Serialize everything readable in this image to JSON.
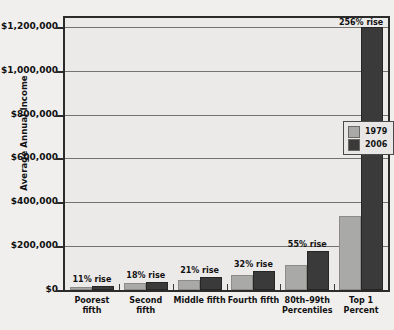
{
  "chart_data": {
    "type": "bar",
    "title": "",
    "xlabel": "",
    "ylabel": "Average Annual Income",
    "ylim": [
      0,
      1240000
    ],
    "grid": true,
    "legend_position": "inside-right",
    "categories": [
      "Poorest fifth",
      "Second fifth",
      "Middle fifth",
      "Fourth fifth",
      "80th–99th\nPercentiles",
      "Top 1 Percent"
    ],
    "category_lines": [
      [
        "Poorest fifth"
      ],
      [
        "Second fifth"
      ],
      [
        "Middle fifth"
      ],
      [
        "Fourth fifth"
      ],
      [
        "80th–99th",
        "Percentiles"
      ],
      [
        "Top 1 Percent"
      ]
    ],
    "ytick_labels": [
      "$1,200,000",
      "$1,000,000",
      "$800,000",
      "$600,000",
      "$400,000",
      "$200,000",
      "$0"
    ],
    "ytick_values": [
      1200000,
      1000000,
      800000,
      600000,
      400000,
      200000,
      0
    ],
    "series": [
      {
        "name": "1979",
        "color": "#a9a9a7",
        "values": [
          15300,
          31300,
          47700,
          66200,
          116000,
          337000
        ]
      },
      {
        "name": "2006",
        "color": "#3a3a3a",
        "values": [
          17000,
          36900,
          57700,
          87400,
          180000,
          1200000
        ]
      }
    ],
    "annotations": [
      "11% rise",
      "18% rise",
      "21% rise",
      "32% rise",
      "55% rise",
      "256% rise"
    ]
  },
  "legend": {
    "entries": [
      {
        "label": "1979",
        "color": "#a9a9a7"
      },
      {
        "label": "2006",
        "color": "#3a3a3a"
      }
    ]
  }
}
